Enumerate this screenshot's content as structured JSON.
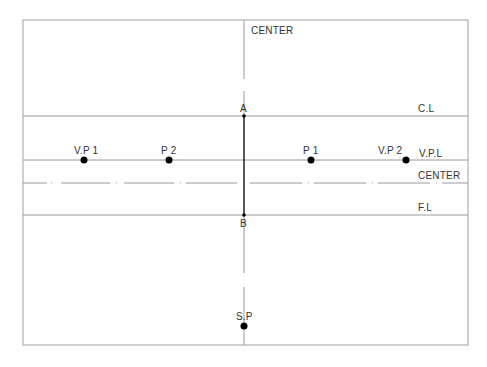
{
  "diagram": {
    "colors": {
      "line": "#9a9a9a",
      "frame": "#a0a0a0",
      "bold_line": "#222222",
      "point": "#000000",
      "text": "#333333"
    },
    "frame": {
      "x1": 23,
      "y1": 20,
      "x2": 468,
      "y2": 345
    },
    "lines": {
      "cl": {
        "label": "C.L",
        "y": 116
      },
      "vpl": {
        "label": "V.P.L",
        "y": 160
      },
      "center_h": {
        "label": "CENTER",
        "y": 183
      },
      "fl": {
        "label": "F.L",
        "y": 215
      },
      "center_v": {
        "label": "CENTER",
        "x": 244
      }
    },
    "points": {
      "vp1": {
        "label": "V.P 1",
        "x": 84,
        "y": 160
      },
      "p2": {
        "label": "P 2",
        "x": 169,
        "y": 160
      },
      "p1": {
        "label": "P 1",
        "x": 311,
        "y": 160
      },
      "vp2": {
        "label": "V.P 2",
        "x": 406,
        "y": 160
      },
      "a": {
        "label": "A",
        "x": 244,
        "y": 116
      },
      "b": {
        "label": "B",
        "x": 244,
        "y": 215
      },
      "sp": {
        "label": "S.P",
        "x": 244,
        "y": 326
      }
    }
  }
}
